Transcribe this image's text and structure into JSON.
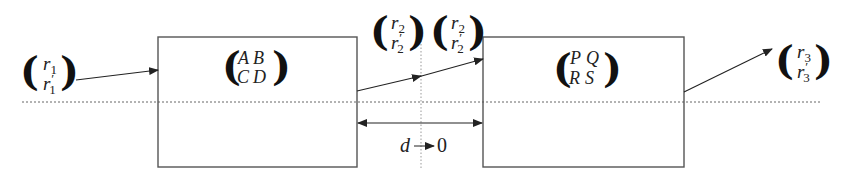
{
  "diagram": {
    "type": "ray-transfer-matrix-cascade",
    "input_vector": {
      "top": "r",
      "top_sub": "1",
      "bottom": "r",
      "bottom_prime": "′",
      "bottom_sub": "1"
    },
    "system1": {
      "label": "system-ABCD",
      "matrix": {
        "a": "A",
        "b": "B",
        "c": "C",
        "d": "D"
      }
    },
    "gap_vector_left": {
      "top": "r",
      "top_sub": "2",
      "bottom": "r",
      "bottom_prime": "′",
      "bottom_sub": "2"
    },
    "gap_vector_right": {
      "top": "r",
      "top_sub": "2",
      "bottom": "r",
      "bottom_prime": "′",
      "bottom_sub": "2"
    },
    "system2": {
      "label": "system-PQRS",
      "matrix": {
        "a": "P",
        "b": "Q",
        "c": "R",
        "d": "S"
      }
    },
    "output_vector": {
      "top": "r",
      "top_sub": "3",
      "bottom": "r",
      "bottom_prime": "′",
      "bottom_sub": "3"
    },
    "gap_label": {
      "variable": "d",
      "arrow": "→",
      "limit": "0"
    },
    "colors": {
      "line": "#333333",
      "box": "#555555",
      "dotted": "#666666",
      "background": "#ffffff"
    }
  }
}
